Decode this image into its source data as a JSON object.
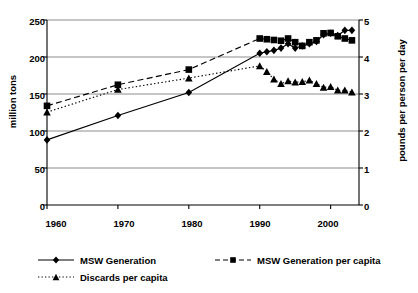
{
  "chart_data": {
    "type": "line",
    "title": "",
    "xlabel": "",
    "ylabel": "million tons",
    "ylabel_right": "pounds per person per day",
    "xlim": [
      1960,
      2004
    ],
    "ylim": [
      0,
      250
    ],
    "ylim_right": [
      0,
      5
    ],
    "grid": true,
    "legend_position": "bottom",
    "yticks": [
      0,
      50,
      100,
      150,
      200,
      250
    ],
    "yticks_right": [
      0,
      1,
      2,
      3,
      4,
      5
    ],
    "xticks": [
      1960,
      1970,
      1980,
      1990,
      2000
    ],
    "x": [
      1960,
      1970,
      1980,
      1990,
      1991,
      1992,
      1993,
      1994,
      1995,
      1996,
      1997,
      1998,
      1999,
      2000,
      2001,
      2002,
      2003
    ],
    "series": [
      {
        "name": "MSW Generation",
        "axis": "left",
        "units": "million tons",
        "marker": "diamond",
        "line_style": "solid",
        "values": [
          88,
          121,
          152,
          205,
          207,
          209,
          212,
          218,
          212,
          215,
          218,
          221,
          230,
          232,
          229,
          236,
          236
        ]
      },
      {
        "name": "MSW Generation per capita",
        "axis": "right",
        "units": "pounds per person per day",
        "marker": "square",
        "line_style": "dashed",
        "values": [
          2.68,
          3.25,
          3.66,
          4.5,
          4.48,
          4.46,
          4.44,
          4.5,
          4.4,
          4.3,
          4.4,
          4.45,
          4.64,
          4.65,
          4.56,
          4.5,
          4.45
        ]
      },
      {
        "name": "Discards per capita",
        "axis": "right",
        "units": "pounds per person per day",
        "marker": "triangle",
        "line_style": "dotted",
        "values": [
          2.51,
          3.12,
          3.43,
          3.76,
          3.6,
          3.4,
          3.28,
          3.35,
          3.32,
          3.33,
          3.37,
          3.28,
          3.18,
          3.2,
          3.1,
          3.1,
          3.05
        ]
      }
    ],
    "legend": [
      {
        "label": "MSW Generation",
        "marker": "diamond",
        "line_style": "solid"
      },
      {
        "label": "MSW Generation per capita",
        "marker": "square",
        "line_style": "dashed"
      },
      {
        "label": "Discards per capita",
        "marker": "triangle",
        "line_style": "dotted"
      }
    ]
  },
  "axes": {
    "left_title": "million tons",
    "right_title": "pounds per person per day",
    "left_ticks": [
      "250",
      "200",
      "150",
      "100",
      "50",
      "0"
    ],
    "right_ticks": [
      "5",
      "4",
      "3",
      "2",
      "1",
      "0"
    ],
    "x_ticks": [
      "1960",
      "1970",
      "1980",
      "1990",
      "2000"
    ]
  },
  "legend": {
    "item0": "MSW Generation",
    "item1": "MSW Generation per capita",
    "item2": "Discards per capita"
  },
  "colors": {
    "line": "#000000",
    "grid": "#808080",
    "axis": "#000000",
    "background": "#ffffff"
  }
}
